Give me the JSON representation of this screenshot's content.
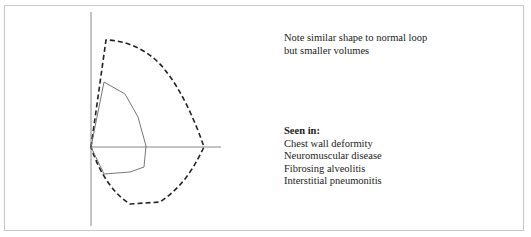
{
  "note": {
    "lines": [
      "Note similar shape to normal loop",
      "but smaller volumes"
    ]
  },
  "seen_in": {
    "heading": "Seen in:",
    "items": [
      "Chest wall deformity",
      "Neuromuscular disease",
      "Fibrosing alveolitis",
      "Interstitial pneumonitis"
    ]
  },
  "diagram": {
    "type": "flow-volume loop",
    "loops": [
      {
        "name": "normal-loop",
        "style": "dashed",
        "color": "#222222"
      },
      {
        "name": "restrictive-loop",
        "style": "solid",
        "color": "#777777"
      }
    ],
    "axis_color": "#888888"
  }
}
